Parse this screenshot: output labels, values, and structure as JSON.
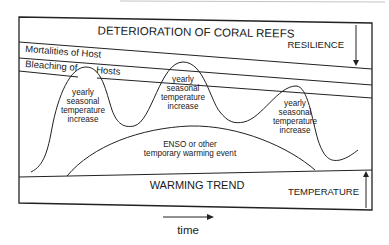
{
  "diagram": {
    "title": "DETERIORATION OF CORAL REEFS",
    "resilience_label": "RESILIENCE",
    "temperature_label": "TEMPERATURE",
    "bands": {
      "mortalities": "Mortalities of Host",
      "bleaching_left": "Bleaching of",
      "bleaching_right": "Hosts"
    },
    "peaks": [
      {
        "lines": [
          "yearly",
          "seasonal",
          "temperature",
          "increase"
        ]
      },
      {
        "lines": [
          "yearly",
          "seasonal",
          "temperature",
          "increase"
        ]
      },
      {
        "lines": [
          "yearly",
          "seasonal",
          "temperature",
          "increase"
        ]
      }
    ],
    "enso": {
      "lines": [
        "ENSO or other",
        "temporary warming event"
      ]
    },
    "trend_label": "WARMING TREND",
    "time_label": "time"
  },
  "colors": {
    "line": "#222222",
    "text": "#1a1a1a",
    "faint": "#bdbdbd"
  }
}
